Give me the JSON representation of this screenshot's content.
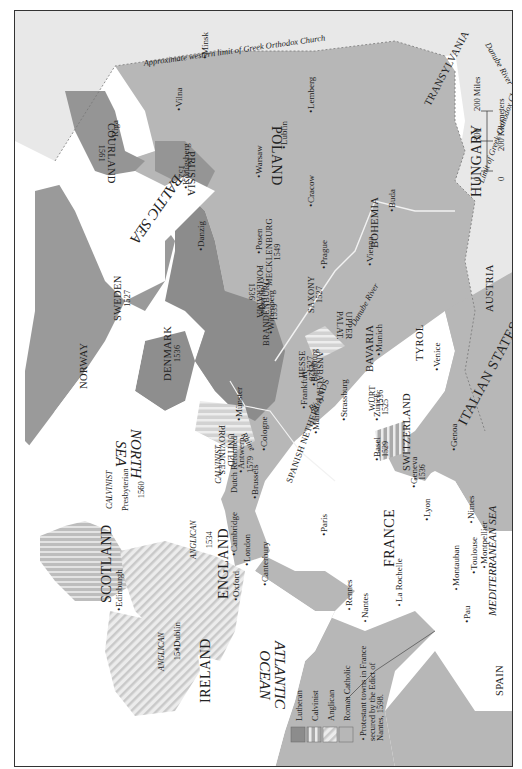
{
  "map": {
    "title": "Religious divisions of Europe c. 1560",
    "orientation": "rotated 90 degrees clockwise (north points right)",
    "colors": {
      "lutheran": "#8c8c8c",
      "calvinist_stripe": "#bdbdbd",
      "anglican_hatch": "#c8c8c8",
      "roman_catholic": "#b4b4b4",
      "greek_orthodox_area": "#e6e6e6",
      "sea": "#ffffff",
      "frame": "#333333"
    },
    "seas": {
      "north_sea": "NORTH SEA",
      "north_sea_l1": "NORTH",
      "north_sea_l2": "SEA",
      "baltic_sea": "BALTIC SEA",
      "atlantic_l1": "ATLANTIC",
      "atlantic_l2": "OCEAN",
      "mediterranean": "MEDITERRANEAN SEA"
    },
    "boundaries": {
      "orthodox_west_limit": "Approximate western limit of Greek Orthodox Church",
      "orthodox_limit_south": "Limit of Greek Orthodox Church",
      "danube_east": "Danube River",
      "danube_central": "Danube River",
      "rhine_north": "Rhine",
      "rhine_central": "River"
    },
    "regions": [
      {
        "name": "NORWAY"
      },
      {
        "name": "SWEDEN",
        "year": "1527"
      },
      {
        "name": "DENMARK",
        "year": "1536"
      },
      {
        "name": "COURLAND",
        "year": "1561"
      },
      {
        "name": "PRUSSIA",
        "year": "1525"
      },
      {
        "name": "POLAND"
      },
      {
        "name": "TRANSYLVANIA"
      },
      {
        "name": "HUNGARY"
      },
      {
        "name": "BOHEMIA"
      },
      {
        "name": "AUSTRIA"
      },
      {
        "name": "POMERANIA",
        "year": "1536"
      },
      {
        "name": "MECKLENBURG",
        "year": "1549"
      },
      {
        "name": "BRANDENBURG",
        "year": "1539"
      },
      {
        "name": "SAXONY",
        "year": "1527"
      },
      {
        "name": "HESSE",
        "year": "1527"
      },
      {
        "name": "ANSBACH",
        "year": "1528"
      },
      {
        "name": "WÜRT",
        "year": "1536"
      },
      {
        "name": "UPPER PALAT.",
        "l1": "UPPER",
        "l2": "PALAT."
      },
      {
        "name": "BAVARIA"
      },
      {
        "name": "TYROL"
      },
      {
        "name": "SWITZERLAND"
      },
      {
        "name": "ITALIAN STATES"
      },
      {
        "name": "UNITED PROVINCES",
        "l1": "UNITED",
        "l2": "PROVINCES"
      },
      {
        "name": "SPANISH NETHERLANDS"
      },
      {
        "name": "FRANCE"
      },
      {
        "name": "SPAIN"
      },
      {
        "name": "ENGLAND"
      },
      {
        "name": "SCOTLAND"
      },
      {
        "name": "IRELAND"
      }
    ],
    "faith_notes": {
      "scotland": {
        "faith": "CALVINIST",
        "church": "Presbyterian",
        "year": "1560"
      },
      "netherlands": {
        "faith": "CALVINIST",
        "church": "Dutch Reformed",
        "year": "1579"
      },
      "england": {
        "faith": "ANGLICAN",
        "year": "1534"
      },
      "ireland": {
        "faith": "ANGLICAN",
        "year": "1541"
      }
    },
    "cities": {
      "minsk": "Minsk",
      "riga": "Riga",
      "vilna": "Vilna",
      "konigsberg": "Königsberg",
      "danzig": "Danzig",
      "warsaw": "Warsaw",
      "lublin": "Lublin",
      "lemberg": "Lemberg",
      "posen": "Posen",
      "cracow": "Cracow",
      "buda": "Buda",
      "vienna": "Vienna",
      "prague": "Prague",
      "berlin": "Berlin",
      "wittenberg": "Wittenberg",
      "munster": "Münster",
      "frankfurt": "Frankfurt",
      "bamburg": "Bamburg",
      "mainz": "Mainz",
      "cologne": "Cologne",
      "strassburg": "Strassburg",
      "munich": "Munich",
      "zurich": "Zurich",
      "zurich_year": "1525",
      "basel": "Basel",
      "basel_year": "1529",
      "geneva": "Geneva",
      "geneva_year": "1536",
      "venice": "Venice",
      "genoa": "Genoa",
      "antwerp": "Antwerp",
      "brussels": "Brussels",
      "paris": "Paris",
      "lyon": "Lyon",
      "nimes": "Nimes",
      "montpellier": "Montpellier",
      "toulouse": "Toulouse",
      "montauban": "Montauban",
      "pau": "Pau",
      "la_rochelle": "La Rochelle",
      "nantes": "Nantes",
      "rennes": "Rennes",
      "london": "London",
      "cambridge": "Cambridge",
      "oxford": "Oxford",
      "canterbury": "Canterbury",
      "edinburgh": "Edinburgh",
      "dublin": "Dublin"
    },
    "scale": {
      "miles_label": "200 Miles",
      "km_label": "200 Kilometers",
      "tick_0": "0",
      "tick_100": "100",
      "tick_0_km": "0"
    },
    "legend": {
      "items": [
        {
          "label": "Lutheran",
          "swatch": "solid-dark"
        },
        {
          "label": "Calvinist",
          "swatch": "stripes"
        },
        {
          "label": "Anglican",
          "swatch": "diagonal-hatch"
        },
        {
          "label": "Roman Catholic",
          "swatch": "solid-light"
        }
      ],
      "protestant_towns_l1": "Protestant towns in France",
      "protestant_towns_l2": "secured by the Edict of",
      "protestant_towns_l3": "Nantes, 1598."
    }
  }
}
